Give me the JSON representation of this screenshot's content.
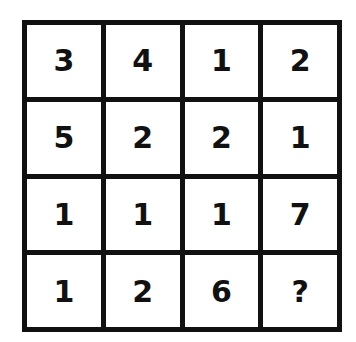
{
  "puzzle": {
    "rows": [
      [
        "3",
        "4",
        "1",
        "2"
      ],
      [
        "5",
        "2",
        "2",
        "1"
      ],
      [
        "1",
        "1",
        "1",
        "7"
      ],
      [
        "1",
        "2",
        "6",
        "?"
      ]
    ]
  },
  "colors": {
    "line": "#111111",
    "background": "#ffffff"
  }
}
